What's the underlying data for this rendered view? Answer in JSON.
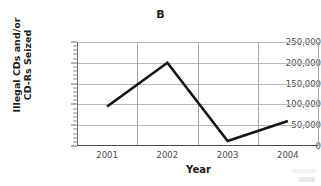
{
  "chart_data": {
    "type": "line",
    "title": "B",
    "xlabel": "Year",
    "ylabel": "Illegal CDs and/or CD-Rs Seized",
    "ylabel_line1": "Illegal CDs and/or",
    "ylabel_line2": "CD-Rs Seized",
    "categories": [
      "2001",
      "2002",
      "2003",
      "2004"
    ],
    "values": [
      95000,
      200000,
      12000,
      60000
    ],
    "ylim": [
      0,
      250000
    ],
    "ytick_labels": [
      "250,000",
      "200,000",
      "150,000",
      "100,000",
      "50,000",
      "0"
    ],
    "ytick_values": [
      250000,
      200000,
      150000,
      100000,
      50000,
      0
    ],
    "minor_tick_step": 10000,
    "grid": "both",
    "legend": "none",
    "line_color": "#141414",
    "grid_color": "#b9b9b9",
    "axis_color": "#4a4a4a",
    "markers": "none"
  }
}
